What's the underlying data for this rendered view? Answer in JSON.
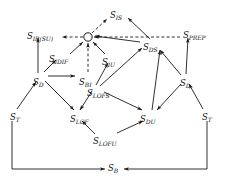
{
  "diagram": {
    "title": "",
    "type": "directed-graph-lattice",
    "background": "#ffffff",
    "edge_color": "#1a1a1a",
    "node_text_color": "#111111",
    "center_node": {
      "name": "center-circle-node",
      "shape": "open-circle",
      "label": "",
      "x": 88,
      "y": 37
    },
    "nodes": [
      {
        "id": "S_IS",
        "base": "S",
        "sub": "IS",
        "x": 110,
        "y": 11,
        "align": "left"
      },
      {
        "id": "S_IR_SU",
        "base": "S",
        "sub": "IR(SU)",
        "x": 27,
        "y": 32,
        "align": "left"
      },
      {
        "id": "S_PREP",
        "base": "S",
        "sub": "PREP",
        "x": 183,
        "y": 31,
        "align": "left"
      },
      {
        "id": "S_DS",
        "base": "S",
        "sub": "DS",
        "x": 143,
        "y": 43,
        "align": "left"
      },
      {
        "id": "S_IDIF",
        "base": "S",
        "sub": "IDIF",
        "x": 49,
        "y": 55,
        "align": "left"
      },
      {
        "id": "S_IU",
        "base": "S",
        "sub": "IU",
        "x": 102,
        "y": 58,
        "align": "left"
      },
      {
        "id": "S_D_left",
        "base": "S",
        "sub": "D",
        "x": 33,
        "y": 78,
        "align": "left"
      },
      {
        "id": "S_BI",
        "base": "S",
        "sub": "BI",
        "x": 79,
        "y": 78,
        "align": "left"
      },
      {
        "id": "S_LOFS",
        "base": "S",
        "sub": "LOFS",
        "x": 87,
        "y": 89,
        "align": "left"
      },
      {
        "id": "S_D_right",
        "base": "S",
        "sub": "D",
        "x": 180,
        "y": 79,
        "align": "left"
      },
      {
        "id": "S_T_left",
        "base": "S",
        "sub": "T",
        "x": 10,
        "y": 113,
        "align": "left"
      },
      {
        "id": "S_LOF",
        "base": "S",
        "sub": "LOF",
        "x": 70,
        "y": 115,
        "align": "left"
      },
      {
        "id": "S_DU",
        "base": "S",
        "sub": "DU",
        "x": 140,
        "y": 115,
        "align": "left"
      },
      {
        "id": "S_T_right",
        "base": "S",
        "sub": "T",
        "x": 202,
        "y": 113,
        "align": "left"
      },
      {
        "id": "S_LOFU",
        "base": "S",
        "sub": "LOFU",
        "x": 93,
        "y": 137,
        "align": "left"
      },
      {
        "id": "S_B",
        "base": "S",
        "sub": "B",
        "x": 108,
        "y": 164,
        "align": "left"
      }
    ],
    "edges": [
      {
        "from": "center",
        "to": "S_IS",
        "style": "dashed",
        "arrow": "to-target"
      },
      {
        "from": "center",
        "to": "S_IR_SU",
        "style": "dashed",
        "arrow": "to-target"
      },
      {
        "from": "S_PREP",
        "to": "center",
        "style": "dashed",
        "arrow": "to-target"
      },
      {
        "from": "S_IS",
        "to": "center",
        "style": "dashed",
        "arrow": "to-target"
      },
      {
        "from": "S_BI",
        "to": "center",
        "style": "dashed",
        "arrow": "to-target"
      },
      {
        "from": "S_IDIF",
        "to": "center",
        "style": "solid",
        "arrow": "to-target"
      },
      {
        "from": "S_IU",
        "to": "center",
        "style": "solid",
        "arrow": "to-target"
      },
      {
        "from": "S_DS",
        "to": "center",
        "style": "solid",
        "arrow": "to-target"
      },
      {
        "from": "S_D_left",
        "to": "S_IR_SU",
        "style": "solid",
        "arrow": "to-target"
      },
      {
        "from": "S_D_left",
        "to": "S_IDIF",
        "style": "solid",
        "arrow": "to-target"
      },
      {
        "from": "S_D_left",
        "to": "S_BI",
        "style": "solid",
        "arrow": "to-target"
      },
      {
        "from": "S_D_left",
        "to": "S_LOF",
        "style": "solid",
        "arrow": "to-target"
      },
      {
        "from": "S_T_left",
        "to": "S_D_left",
        "style": "solid",
        "arrow": "to-target"
      },
      {
        "from": "S_LOFS",
        "to": "S_IU",
        "style": "solid",
        "arrow": "to-target"
      },
      {
        "from": "S_LOFS",
        "to": "S_LOF",
        "style": "solid",
        "arrow": "to-target"
      },
      {
        "from": "S_LOFS",
        "to": "S_DS",
        "style": "solid",
        "arrow": "to-target"
      },
      {
        "from": "S_LOFS",
        "to": "S_DU",
        "style": "solid",
        "arrow": "to-target"
      },
      {
        "from": "S_DS",
        "to": "S_IS",
        "style": "solid",
        "arrow": "to-target"
      },
      {
        "from": "S_DU",
        "to": "S_DS",
        "style": "solid",
        "arrow": "to-target"
      },
      {
        "from": "S_D_right",
        "to": "S_PREP",
        "style": "solid",
        "arrow": "to-target"
      },
      {
        "from": "S_D_right",
        "to": "S_DS",
        "style": "solid",
        "arrow": "to-target"
      },
      {
        "from": "S_D_right",
        "to": "S_DU",
        "style": "solid",
        "arrow": "to-target"
      },
      {
        "from": "S_T_right",
        "to": "S_D_right",
        "style": "solid",
        "arrow": "to-target"
      },
      {
        "from": "S_LOFU",
        "to": "S_LOF",
        "style": "solid",
        "arrow": "to-target"
      },
      {
        "from": "S_LOFU",
        "to": "S_DU",
        "style": "solid",
        "arrow": "to-target"
      },
      {
        "from": "S_T_left",
        "to": "S_B",
        "style": "solid",
        "arrow": "to-target"
      },
      {
        "from": "S_T_right",
        "to": "S_B",
        "style": "solid",
        "arrow": "to-target"
      }
    ]
  }
}
